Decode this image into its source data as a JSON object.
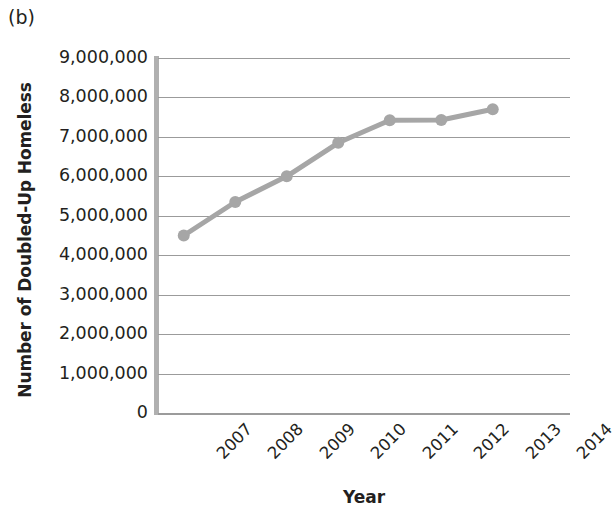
{
  "panel": {
    "label": "(b)"
  },
  "axes": {
    "x_title": "Year",
    "y_title": "Number of Doubled-Up Homeless",
    "y_tick_labels": [
      "9,000,000",
      "8,000,000",
      "7,000,000",
      "6,000,000",
      "5,000,000",
      "4,000,000",
      "3,000,000",
      "2,000,000",
      "1,000,000",
      "0"
    ],
    "x_tick_labels": [
      "2007",
      "2008",
      "2009",
      "2010",
      "2011",
      "2012",
      "2013",
      "2014"
    ]
  },
  "style": {
    "series_color": "#a6a6a6",
    "gridline_color": "#9b9b9b",
    "axis_color": "#b0b0b0",
    "text_color": "#231f20",
    "background": "#ffffff"
  },
  "chart_data": {
    "type": "line",
    "title": "(b)",
    "xlabel": "Year",
    "ylabel": "Number of Doubled-Up Homeless",
    "categories": [
      "2007",
      "2008",
      "2009",
      "2010",
      "2011",
      "2012",
      "2013",
      "2014"
    ],
    "values": [
      4500000,
      5350000,
      6000000,
      6850000,
      7420000,
      7430000,
      7700000,
      null
    ],
    "ylim": [
      0,
      9000000
    ],
    "ytick_interval": 1000000,
    "yticks": [
      0,
      1000000,
      2000000,
      3000000,
      4000000,
      5000000,
      6000000,
      7000000,
      8000000,
      9000000
    ],
    "grid": true,
    "grid_axis": "y",
    "legend": false,
    "marker": "circle",
    "series_color": "#a6a6a6"
  }
}
